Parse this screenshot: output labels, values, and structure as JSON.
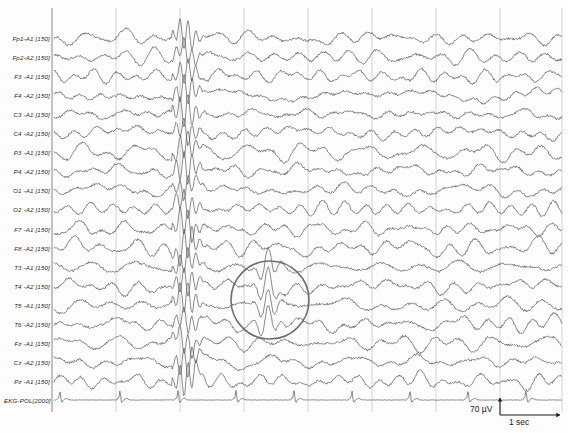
{
  "recording": {
    "type": "eeg-polysomnography-trace",
    "montage": "referential 10-20 (A1/A2 ears)",
    "background_color": "#fdfdfd",
    "trace_color": "#4a4a52",
    "grid_color": "#c9c9cf",
    "separator_color": "#9a9aa2",
    "annotation_color": "#6e6e76"
  },
  "channels": [
    {
      "label": "Fp1-A1 [150]",
      "name": "Fp1-A1",
      "filter": "150",
      "y": 38
    },
    {
      "label": "Fp2-A2 [150]",
      "name": "Fp2-A2",
      "filter": "150",
      "y": 57
    },
    {
      "label": "F3 -A1 [150]",
      "name": "F3-A1",
      "filter": "150",
      "y": 76
    },
    {
      "label": "F4 -A2 [150]",
      "name": "F4-A2",
      "filter": "150",
      "y": 95
    },
    {
      "label": "C3 -A1 [150]",
      "name": "C3-A1",
      "filter": "150",
      "y": 114
    },
    {
      "label": "C4 -A2 [150]",
      "name": "C4-A2",
      "filter": "150",
      "y": 133
    },
    {
      "label": "P3 -A1 [150]",
      "name": "P3-A1",
      "filter": "150",
      "y": 152
    },
    {
      "label": "P4 -A2 [150]",
      "name": "P4-A2",
      "filter": "150",
      "y": 171
    },
    {
      "label": "O1 -A1 [150]",
      "name": "O1-A1",
      "filter": "150",
      "y": 190
    },
    {
      "label": "O2 -A2 [150]",
      "name": "O2-A2",
      "filter": "150",
      "y": 209
    },
    {
      "label": "F7 -A1 [150]",
      "name": "F7-A1",
      "filter": "150",
      "y": 229
    },
    {
      "label": "F8 -A2 [150]",
      "name": "F8-A2",
      "filter": "150",
      "y": 248
    },
    {
      "label": "T3 -A1 [150]",
      "name": "T3-A1",
      "filter": "150",
      "y": 267
    },
    {
      "label": "T4 -A2 [150]",
      "name": "T4-A2",
      "filter": "150",
      "y": 286
    },
    {
      "label": "T5 -A1 [150]",
      "name": "T5-A1",
      "filter": "150",
      "y": 305
    },
    {
      "label": "T6 -A2 [150]",
      "name": "T6-A2",
      "filter": "150",
      "y": 324
    },
    {
      "label": "Fz -A1 [150]",
      "name": "Fz-A1",
      "filter": "150",
      "y": 343
    },
    {
      "label": "Cz -A2 [150]",
      "name": "Cz-A2",
      "filter": "150",
      "y": 362
    },
    {
      "label": "Pz -A1 [150]",
      "name": "Pz-A1",
      "filter": "150",
      "y": 381
    },
    {
      "label": "EKG-POL[2000]",
      "name": "EKG-POL",
      "filter": "2000",
      "y": 400
    }
  ],
  "calibration": {
    "voltage_label": "70 µV",
    "time_label": "1 sec",
    "voltage_bar": {
      "x": 500,
      "y_top": 398,
      "y_bottom": 415
    },
    "time_bar": {
      "y": 415,
      "x_left": 500,
      "x_right": 560
    }
  },
  "grid": {
    "plot_left": 52,
    "plot_right": 562,
    "plot_top": 8,
    "plot_bottom": 412,
    "vertical_line_x": [
      52,
      116,
      180,
      244,
      308,
      372,
      436,
      500,
      562
    ],
    "separator_x": 52
  },
  "annotation": {
    "shape": "ellipse",
    "purpose": "highlight-spike-wave-discharge",
    "cx": 270,
    "cy": 300,
    "rx": 39,
    "ry": 39
  },
  "events": {
    "generalized_discharge_x": 186,
    "ekg_qrs_x": [
      60,
      120,
      178,
      236,
      294,
      352,
      410,
      468,
      526
    ]
  }
}
